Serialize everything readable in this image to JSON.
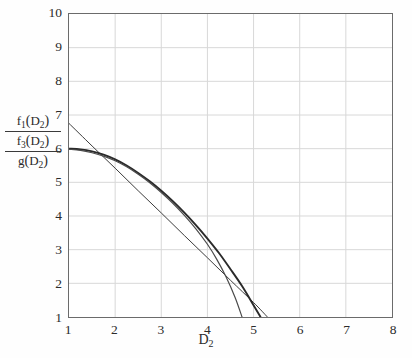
{
  "chart_data": {
    "type": "line",
    "title": "",
    "xlabel": "D2",
    "xlabel_display": "D",
    "xlabel_sub": "2",
    "ylabel": "f1(D2) / f3(D2) / g(D2)",
    "xlim": [
      1,
      8
    ],
    "ylim": [
      1,
      10
    ],
    "xticks": [
      1,
      2,
      3,
      4,
      5,
      6,
      7,
      8
    ],
    "yticks": [
      1,
      2,
      3,
      4,
      5,
      6,
      7,
      8,
      9,
      10
    ],
    "grid": true,
    "legend": "none",
    "series": [
      {
        "name": "f1(D2)",
        "style": "solid-thin",
        "color": "#3a3a3a",
        "x": [
          1.0,
          1.5,
          2.0,
          2.5,
          3.0,
          3.5,
          4.0,
          4.5,
          5.0,
          5.3
        ],
        "y": [
          6.75,
          6.08,
          5.42,
          4.75,
          4.09,
          3.42,
          2.76,
          2.09,
          1.43,
          1.0
        ]
      },
      {
        "name": "f3(D2)",
        "style": "solid-thick",
        "color": "#2a2a2a",
        "x": [
          1.0,
          1.25,
          1.5,
          1.75,
          2.0,
          2.25,
          2.5,
          2.75,
          3.0,
          3.25,
          3.5,
          3.75,
          4.0,
          4.25,
          4.5,
          4.75,
          5.0,
          5.15
        ],
        "y": [
          6.0,
          5.98,
          5.92,
          5.82,
          5.68,
          5.5,
          5.28,
          5.03,
          4.75,
          4.44,
          4.1,
          3.73,
          3.33,
          2.9,
          2.42,
          1.92,
          1.35,
          1.0
        ]
      },
      {
        "name": "g(D2)",
        "style": "solid-medium",
        "color": "#4a4a4a",
        "x": [
          1.0,
          1.25,
          1.5,
          1.75,
          2.0,
          2.25,
          2.5,
          2.75,
          3.0,
          3.25,
          3.5,
          3.75,
          4.0,
          4.2,
          4.4,
          4.6,
          4.75
        ],
        "y": [
          5.98,
          5.95,
          5.88,
          5.78,
          5.64,
          5.46,
          5.24,
          4.99,
          4.7,
          4.38,
          4.02,
          3.62,
          3.16,
          2.72,
          2.2,
          1.58,
          1.0
        ]
      }
    ]
  },
  "axis": {
    "y_label_rows": [
      {
        "fn": "f",
        "fn_sub": "1",
        "arg": "D",
        "arg_sub": "2"
      },
      {
        "fn": "f",
        "fn_sub": "3",
        "arg": "D",
        "arg_sub": "2"
      },
      {
        "fn": "g",
        "fn_sub": "",
        "arg": "D",
        "arg_sub": "2"
      }
    ]
  },
  "colors": {
    "axis": "#6b6b6b",
    "grid": "#d8d8d8",
    "text": "#2b2b2b",
    "background": "#fefefe",
    "plot_background": "#ffffff"
  }
}
